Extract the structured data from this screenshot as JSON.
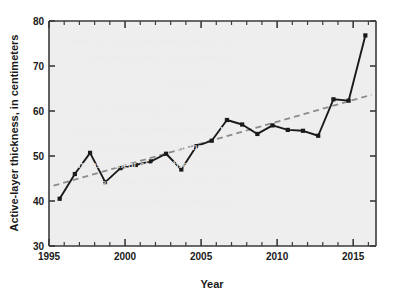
{
  "chart_data": {
    "type": "line",
    "title": "",
    "xlabel": "Year",
    "ylabel": "Active-layer thickness, in centimeters",
    "xlim": [
      1995,
      2016.5
    ],
    "ylim": [
      30,
      80
    ],
    "grid": false,
    "legend": "none",
    "x_ticks_major": [
      1995,
      2000,
      2005,
      2010,
      2015
    ],
    "x_tick_labels": [
      "1995",
      "2000",
      "2005",
      "2010",
      "2015"
    ],
    "x_ticks_minor": [
      1996,
      1997,
      1998,
      1999,
      2001,
      2002,
      2003,
      2004,
      2006,
      2007,
      2008,
      2009,
      2011,
      2012,
      2013,
      2014,
      2016
    ],
    "y_ticks": [
      30,
      40,
      50,
      60,
      70,
      80
    ],
    "y_tick_labels": [
      "30",
      "40",
      "50",
      "60",
      "70",
      "80"
    ],
    "series": [
      {
        "name": "Active-layer thickness",
        "style": "solid-with-square-markers",
        "color": "#1a1a1a",
        "x": [
          1995.7,
          1996.7,
          1997.7,
          1998.7,
          1999.7,
          2000.7,
          2001.7,
          2002.7,
          2003.7,
          2004.7,
          2005.7,
          2006.7,
          2007.7,
          2008.7,
          2009.7,
          2010.7,
          2011.7,
          2012.7,
          2013.7,
          2014.7,
          2015.8
        ],
        "values": [
          40.5,
          46.0,
          50.7,
          44.2,
          47.3,
          48.0,
          48.8,
          50.5,
          47.0,
          52.2,
          53.4,
          58.0,
          57.0,
          54.9,
          56.8,
          55.8,
          55.6,
          54.5,
          62.6,
          62.3,
          76.8
        ]
      },
      {
        "name": "Linear trend",
        "style": "dashed",
        "color": "#8c8c8c",
        "x": [
          1995.3,
          2016.2
        ],
        "values": [
          43.4,
          63.6
        ]
      }
    ]
  },
  "axes": {
    "x_title": "Year",
    "y_title": "Active-layer thickness, in centimeters"
  },
  "colors": {
    "plot_background": "#eeeeee",
    "page_background": "#ffffff",
    "data_line": "#1a1a1a",
    "trend_line": "#8c8c8c",
    "axis": "#3a3a3a"
  },
  "background_bleed": [
    {
      "text": "and the total of the sum between the",
      "x": 72,
      "y": 34,
      "size": 11
    },
    {
      "text": "of the thickness of the permafrost",
      "x": 84,
      "y": 50,
      "size": 11
    },
    {
      "text": "Methods",
      "x": 168,
      "y": 80,
      "size": 11
    },
    {
      "text": "the monitoring of the",
      "x": 96,
      "y": 104,
      "size": 11
    },
    {
      "text": "period of time in which the thaw was",
      "x": 74,
      "y": 122,
      "size": 11
    },
    {
      "text": "to the end of the season, the active",
      "x": 80,
      "y": 140,
      "size": 11
    },
    {
      "text": "measurement of the observed data",
      "x": 78,
      "y": 158,
      "size": 11
    },
    {
      "text": "at several sites along the study area",
      "x": 76,
      "y": 176,
      "size": 11
    },
    {
      "text": "at a depth of one meter in the active",
      "x": 76,
      "y": 194,
      "size": 11
    }
  ]
}
